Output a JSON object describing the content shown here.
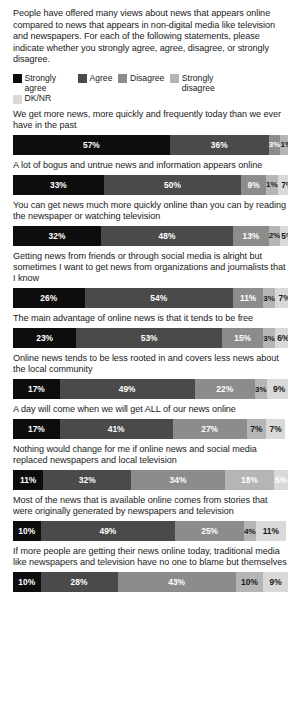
{
  "intro": "People have offered many views about news that appears online compared to news that appears in non-digital media like television and newspapers. For each of the following statements, please indicate whether you strongly agree, agree, disagree, or strongly disagree.",
  "legend": [
    {
      "label": "Strongly agree",
      "color": "#0d0d0d"
    },
    {
      "label": "Agree",
      "color": "#4a4a4a"
    },
    {
      "label": "Disagree",
      "color": "#8c8c8c"
    },
    {
      "label": "Strongly disagree",
      "color": "#b5b5b5"
    },
    {
      "label": "DK/NR",
      "color": "#d9d9d9"
    }
  ],
  "chart_data": {
    "type": "bar",
    "subtype": "100% stacked horizontal",
    "title": "People have offered many views about news that appears online compared to news that appears in non-digital media like television and newspapers. For each of the following statements, please indicate whether you strongly agree, agree, disagree, or strongly disagree.",
    "xlabel": "",
    "ylabel": "",
    "xlim": [
      0,
      100
    ],
    "grid": false,
    "legend_position": "top",
    "value_suffix": "%",
    "series": [
      {
        "name": "Strongly agree",
        "color": "#0d0d0d",
        "values": [
          57,
          33,
          32,
          26,
          23,
          17,
          17,
          11,
          10,
          10
        ]
      },
      {
        "name": "Agree",
        "color": "#4a4a4a",
        "values": [
          36,
          50,
          48,
          54,
          53,
          49,
          41,
          32,
          49,
          28
        ]
      },
      {
        "name": "Disagree",
        "color": "#8c8c8c",
        "values": [
          3,
          9,
          13,
          11,
          15,
          22,
          27,
          34,
          25,
          43
        ]
      },
      {
        "name": "Strongly disagree",
        "color": "#b5b5b5",
        "values": [
          1,
          1,
          2,
          3,
          3,
          3,
          7,
          18,
          4,
          10
        ]
      },
      {
        "name": "DK/NR",
        "color": "#d9d9d9",
        "values": [
          3,
          7,
          5,
          7,
          6,
          9,
          7,
          5,
          11,
          9
        ]
      }
    ],
    "categories": [
      "We get more news, more quickly and frequently today than we ever have in the past",
      "A lot of bogus and untrue news and information appears online",
      "You can get news much more quickly online than you can by reading the newspaper or watching television",
      "Getting news from friends or through social media is alright but sometimes I want to get news from organizations and journalists that I know",
      "The main advantage of online news is that it tends to be free",
      "Online news tends to be less rooted in and covers less news about the local community",
      "A day will come when we will get ALL of our news online",
      "Nothing would change for me if online news and social media replaced newspapers and local television",
      "Most of the news that is available online comes from stories that were originally generated by newspapers and television",
      "If more people are getting their news online today, traditional media like newspapers and television have no one to blame but themselves"
    ]
  },
  "rows": [
    {
      "statement": "We get more news, more quickly and frequently today than we ever have in the past",
      "segments": [
        {
          "label": "57%",
          "value": 57,
          "color": "#0d0d0d",
          "text": "light"
        },
        {
          "label": "36%",
          "value": 36,
          "color": "#4a4a4a",
          "text": "light"
        },
        {
          "label": "3%",
          "value": 3,
          "color": "#8c8c8c",
          "text": "light"
        },
        {
          "label": "1%",
          "value": 1,
          "color": "#b5b5b5",
          "text": "dark"
        },
        {
          "label": "3%",
          "value": 3,
          "color": "#d9d9d9",
          "text": "dark"
        }
      ]
    },
    {
      "statement": "A lot of bogus and untrue news and information appears online",
      "segments": [
        {
          "label": "33%",
          "value": 33,
          "color": "#0d0d0d",
          "text": "light"
        },
        {
          "label": "50%",
          "value": 50,
          "color": "#4a4a4a",
          "text": "light"
        },
        {
          "label": "9%",
          "value": 9,
          "color": "#8c8c8c",
          "text": "light"
        },
        {
          "label": "1%",
          "value": 1,
          "color": "#b5b5b5",
          "text": "dark"
        },
        {
          "label": "7%",
          "value": 7,
          "color": "#d9d9d9",
          "text": "dark"
        }
      ]
    },
    {
      "statement": "You can get news much more quickly online than you can by reading the newspaper or watching television",
      "segments": [
        {
          "label": "32%",
          "value": 32,
          "color": "#0d0d0d",
          "text": "light"
        },
        {
          "label": "48%",
          "value": 48,
          "color": "#4a4a4a",
          "text": "light"
        },
        {
          "label": "13%",
          "value": 13,
          "color": "#8c8c8c",
          "text": "light"
        },
        {
          "label": "2%",
          "value": 2,
          "color": "#b5b5b5",
          "text": "dark"
        },
        {
          "label": "5%",
          "value": 5,
          "color": "#d9d9d9",
          "text": "dark"
        }
      ]
    },
    {
      "statement": "Getting news from friends or through social media is alright but sometimes I want to get news from organizations and journalists that I know",
      "segments": [
        {
          "label": "26%",
          "value": 26,
          "color": "#0d0d0d",
          "text": "light"
        },
        {
          "label": "54%",
          "value": 54,
          "color": "#4a4a4a",
          "text": "light"
        },
        {
          "label": "11%",
          "value": 11,
          "color": "#8c8c8c",
          "text": "light"
        },
        {
          "label": "3%",
          "value": 3,
          "color": "#b5b5b5",
          "text": "dark"
        },
        {
          "label": "7%",
          "value": 7,
          "color": "#d9d9d9",
          "text": "dark"
        }
      ]
    },
    {
      "statement": "The main advantage of online news is that it tends to be free",
      "segments": [
        {
          "label": "23%",
          "value": 23,
          "color": "#0d0d0d",
          "text": "light"
        },
        {
          "label": "53%",
          "value": 53,
          "color": "#4a4a4a",
          "text": "light"
        },
        {
          "label": "15%",
          "value": 15,
          "color": "#8c8c8c",
          "text": "light"
        },
        {
          "label": "3%",
          "value": 3,
          "color": "#b5b5b5",
          "text": "dark"
        },
        {
          "label": "6%",
          "value": 6,
          "color": "#d9d9d9",
          "text": "dark"
        }
      ]
    },
    {
      "statement": "Online news tends to be less rooted in and covers less news about the local community",
      "segments": [
        {
          "label": "17%",
          "value": 17,
          "color": "#0d0d0d",
          "text": "light"
        },
        {
          "label": "49%",
          "value": 49,
          "color": "#4a4a4a",
          "text": "light"
        },
        {
          "label": "22%",
          "value": 22,
          "color": "#8c8c8c",
          "text": "light"
        },
        {
          "label": "3%",
          "value": 3,
          "color": "#b5b5b5",
          "text": "dark"
        },
        {
          "label": "9%",
          "value": 9,
          "color": "#d9d9d9",
          "text": "dark"
        }
      ]
    },
    {
      "statement": "A day will come when we will get ALL of our news online",
      "segments": [
        {
          "label": "17%",
          "value": 17,
          "color": "#0d0d0d",
          "text": "light"
        },
        {
          "label": "41%",
          "value": 41,
          "color": "#4a4a4a",
          "text": "light"
        },
        {
          "label": "27%",
          "value": 27,
          "color": "#8c8c8c",
          "text": "light"
        },
        {
          "label": "7%",
          "value": 7,
          "color": "#b5b5b5",
          "text": "dark"
        },
        {
          "label": "7%",
          "value": 7,
          "color": "#d9d9d9",
          "text": "dark"
        }
      ]
    },
    {
      "statement": "Nothing would change for me if online news and social media replaced newspapers and local television",
      "segments": [
        {
          "label": "11%",
          "value": 11,
          "color": "#0d0d0d",
          "text": "light"
        },
        {
          "label": "32%",
          "value": 32,
          "color": "#4a4a4a",
          "text": "light"
        },
        {
          "label": "34%",
          "value": 34,
          "color": "#8c8c8c",
          "text": "light"
        },
        {
          "label": "18%",
          "value": 18,
          "color": "#b5b5b5",
          "text": "light"
        },
        {
          "label": "5%",
          "value": 5,
          "color": "#d9d9d9",
          "text": "light"
        }
      ]
    },
    {
      "statement": "Most of the news that is available online comes from stories that were originally generated by newspapers and television",
      "segments": [
        {
          "label": "10%",
          "value": 10,
          "color": "#0d0d0d",
          "text": "light"
        },
        {
          "label": "49%",
          "value": 49,
          "color": "#4a4a4a",
          "text": "light"
        },
        {
          "label": "25%",
          "value": 25,
          "color": "#8c8c8c",
          "text": "light"
        },
        {
          "label": "4%",
          "value": 4,
          "color": "#b5b5b5",
          "text": "dark"
        },
        {
          "label": "11%",
          "value": 11,
          "color": "#d9d9d9",
          "text": "dark"
        }
      ]
    },
    {
      "statement": "If more people are getting their news online today, traditional media like newspapers and television have no one to blame but themselves",
      "segments": [
        {
          "label": "10%",
          "value": 10,
          "color": "#0d0d0d",
          "text": "light"
        },
        {
          "label": "28%",
          "value": 28,
          "color": "#4a4a4a",
          "text": "light"
        },
        {
          "label": "43%",
          "value": 43,
          "color": "#8c8c8c",
          "text": "light"
        },
        {
          "label": "10%",
          "value": 10,
          "color": "#b5b5b5",
          "text": "dark"
        },
        {
          "label": "9%",
          "value": 9,
          "color": "#d9d9d9",
          "text": "dark"
        }
      ]
    }
  ]
}
